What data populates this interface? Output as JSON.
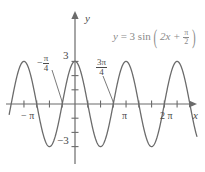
{
  "figure": {
    "equation": {
      "lhs": "y",
      "equals": "=",
      "amplitude": "3",
      "func": "sin",
      "open_paren": "(",
      "inner": "2x +",
      "phase_num": "π",
      "phase_den": "2",
      "close_paren": ")",
      "full_text": "y = 3 sin (2x + π/2)",
      "color": "#8a8a8a"
    },
    "axes": {
      "x_label": "x",
      "y_label": "y",
      "axis_color": "#6b6b6b",
      "origin_px": [
        75,
        104
      ],
      "x_unit_px": 29.9,
      "y_unit_px": 14.2
    },
    "x_ticks": [
      {
        "label": "− π",
        "value": -3.14159
      },
      {
        "label": "",
        "value": -2.35619
      },
      {
        "label": "",
        "value": -1.5708
      },
      {
        "label": "",
        "value": -0.7854
      },
      {
        "label": "",
        "value": 0.7854
      },
      {
        "label": "",
        "value": 1.5708
      },
      {
        "label": "",
        "value": 2.35619
      },
      {
        "label": "π",
        "value": 3.14159
      },
      {
        "label": "",
        "value": 3.92699
      },
      {
        "label": "",
        "value": 4.71239
      },
      {
        "label": "",
        "value": 5.49779
      },
      {
        "label": "2 π",
        "value": 6.28319
      }
    ],
    "y_ticks": [
      {
        "label": "3",
        "value": 3
      },
      {
        "label": "",
        "value": 2
      },
      {
        "label": "",
        "value": 1
      },
      {
        "label": "",
        "value": -1
      },
      {
        "label": "",
        "value": -2
      },
      {
        "label": "−3",
        "value": -3
      }
    ],
    "annotations": [
      {
        "name": "neg-pi-over-4",
        "sign": "−",
        "num": "π",
        "den": "4",
        "value": -0.7854,
        "leader_to": [
          -0.7854,
          0
        ]
      },
      {
        "name": "three-pi-over-4",
        "sign": "",
        "num": "3π",
        "den": "4",
        "value": 2.35619,
        "leader_to": [
          2.35619,
          0
        ]
      }
    ],
    "curve": {
      "color": "#6b6b6b",
      "amplitude": 3,
      "frequency": 2,
      "phase": 1.5708,
      "x_min": -4.05,
      "x_max": 7.5
    }
  },
  "chart_data": {
    "type": "line",
    "title": "",
    "xlabel": "x",
    "ylabel": "y",
    "expression": "y = 3 sin(2x + π/2)",
    "amplitude": 3,
    "period": 3.14159,
    "phase_shift": -0.7854,
    "xlim": [
      -4.05,
      7.5
    ],
    "ylim": [
      -3.6,
      4.3
    ],
    "grid": false,
    "legend": "none",
    "x_tick_labels": [
      "− π",
      "π",
      "2 π"
    ],
    "x_tick_values": [
      -3.14159,
      3.14159,
      6.28319
    ],
    "y_tick_labels": [
      "3",
      "−3"
    ],
    "y_tick_values": [
      3,
      -3
    ],
    "key_points": [
      {
        "x": -3.14159,
        "y": 3,
        "kind": "maximum"
      },
      {
        "x": -2.35619,
        "y": 0,
        "kind": "zero"
      },
      {
        "x": -1.5708,
        "y": -3,
        "kind": "minimum"
      },
      {
        "x": -0.7854,
        "y": 0,
        "kind": "zero"
      },
      {
        "x": 0,
        "y": 3,
        "kind": "maximum"
      },
      {
        "x": 0.7854,
        "y": 0,
        "kind": "zero"
      },
      {
        "x": 1.5708,
        "y": -3,
        "kind": "minimum"
      },
      {
        "x": 2.35619,
        "y": 0,
        "kind": "zero"
      },
      {
        "x": 3.14159,
        "y": 3,
        "kind": "maximum"
      },
      {
        "x": 3.92699,
        "y": 0,
        "kind": "zero"
      },
      {
        "x": 4.71239,
        "y": -3,
        "kind": "minimum"
      },
      {
        "x": 5.49779,
        "y": 0,
        "kind": "zero"
      },
      {
        "x": 6.28319,
        "y": 3,
        "kind": "maximum"
      }
    ]
  }
}
